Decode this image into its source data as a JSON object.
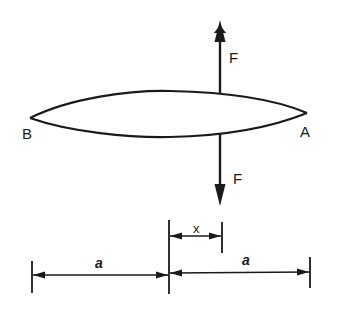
{
  "diagram": {
    "type": "mechanics-free-body",
    "colors": {
      "ink": "#1a1a1a",
      "background": "#ffffff"
    },
    "labels": {
      "left_end": "B",
      "right_end": "A",
      "force_up": "F",
      "force_down": "F",
      "offset": "x",
      "half_length_left": "a",
      "half_length_right": "a"
    },
    "elements": {
      "beam": {
        "shape": "lens",
        "left_tip": [
          30,
          118
        ],
        "right_tip": [
          307,
          113
        ]
      },
      "force_up_arrow": {
        "x": 220,
        "from_y": 93,
        "to_y": 21,
        "direction": "up"
      },
      "force_down_arrow": {
        "x": 220,
        "from_y": 134,
        "to_y": 205,
        "direction": "down"
      },
      "dimension_x": {
        "from_x": 169,
        "to_x": 222,
        "y": 236
      },
      "dimension_a_left": {
        "from_x": 32,
        "to_x": 169,
        "y": 275
      },
      "dimension_a_right": {
        "from_x": 169,
        "to_x": 310,
        "y": 272
      }
    }
  }
}
